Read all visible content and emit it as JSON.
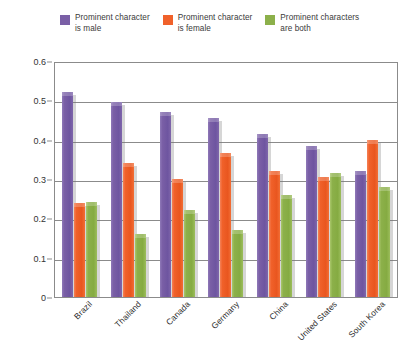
{
  "legend": {
    "items": [
      {
        "label": "Prominent character\nis male",
        "color": "#7a5fa6",
        "name": "male"
      },
      {
        "label": "Prominent character\nis female",
        "color": "#f0612a",
        "name": "female"
      },
      {
        "label": "Prominent characters\nare both",
        "color": "#8cb04a",
        "name": "both"
      }
    ]
  },
  "axis": {
    "y_ticks": [
      "0.6",
      "0.5",
      "0.4",
      "0.3",
      "0.2",
      "0.1",
      "0"
    ],
    "y_values": [
      0.6,
      0.5,
      0.4,
      0.3,
      0.2,
      0.1,
      0
    ]
  },
  "chart_data": {
    "type": "bar",
    "title": "",
    "xlabel": "",
    "ylabel": "",
    "ylim": [
      0,
      0.6
    ],
    "ytick_step": 0.1,
    "grid": true,
    "legend_position": "top",
    "categories": [
      "Brazil",
      "Thailand",
      "Canada",
      "Germany",
      "China",
      "United States",
      "South Korea"
    ],
    "series": [
      {
        "name": "Prominent character is male",
        "color": "#7a5fa6",
        "values": [
          0.52,
          0.495,
          0.47,
          0.455,
          0.415,
          0.385,
          0.32
        ]
      },
      {
        "name": "Prominent character is female",
        "color": "#f0612a",
        "values": [
          0.238,
          0.34,
          0.3,
          0.365,
          0.32,
          0.305,
          0.4
        ]
      },
      {
        "name": "Prominent characters are both",
        "color": "#8cb04a",
        "values": [
          0.242,
          0.16,
          0.22,
          0.17,
          0.26,
          0.315,
          0.28
        ]
      }
    ]
  }
}
